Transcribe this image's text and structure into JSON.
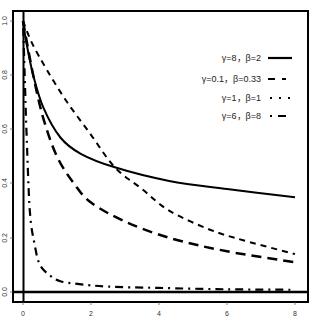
{
  "chart_data": {
    "type": "line",
    "title": "",
    "xlabel": "",
    "ylabel": "",
    "xlim": [
      -0.3,
      8.4
    ],
    "ylim": [
      -0.03,
      1.04
    ],
    "grid": false,
    "legend_position": "top-right",
    "x_ticks": [
      "0",
      "2",
      "4",
      "6",
      "8"
    ],
    "y_ticks": [
      "0.0",
      "0.2",
      "0.4",
      "0.6",
      "0.8",
      "1.0"
    ],
    "reference_lines": {
      "horizontal_y": 0,
      "vertical_x": 0
    },
    "series": [
      {
        "name": "γ=8，β=2",
        "line_style": "solid",
        "x": [
          0,
          0.1,
          0.3,
          0.6,
          1.1,
          1.7,
          2.7,
          4.3,
          6,
          8
        ],
        "values": [
          1.0,
          0.92,
          0.8,
          0.68,
          0.57,
          0.51,
          0.46,
          0.41,
          0.38,
          0.35
        ]
      },
      {
        "name": "γ=0.1，β=0.33",
        "line_style": "dashed",
        "x": [
          0,
          0.26,
          0.7,
          1.3,
          2.0,
          2.7,
          3.5,
          4.3,
          5.5,
          6.5,
          8
        ],
        "values": [
          1.0,
          0.92,
          0.82,
          0.7,
          0.58,
          0.46,
          0.38,
          0.3,
          0.23,
          0.19,
          0.14
        ]
      },
      {
        "name": "γ=1，β=1",
        "line_style": "dotted",
        "x": [
          0,
          0.3,
          0.6,
          1.0,
          1.5,
          2.0,
          3.0,
          4.3,
          6,
          8
        ],
        "values": [
          1.0,
          0.8,
          0.64,
          0.5,
          0.4,
          0.33,
          0.26,
          0.2,
          0.15,
          0.11
        ]
      },
      {
        "name": "γ=6，β=8",
        "line_style": "dotdash",
        "x": [
          0,
          0.05,
          0.1,
          0.2,
          0.35,
          0.5,
          0.8,
          1.1,
          1.6,
          2.5,
          4,
          6,
          8
        ],
        "values": [
          1.0,
          0.8,
          0.6,
          0.3,
          0.17,
          0.1,
          0.06,
          0.04,
          0.03,
          0.02,
          0.015,
          0.01,
          0.008
        ]
      }
    ]
  },
  "legend": {
    "items": [
      {
        "label": "γ=8，β=2"
      },
      {
        "label": "γ=0.1，β=0.33"
      },
      {
        "label": "γ=1，β=1"
      },
      {
        "label": "γ=6，β=8"
      }
    ]
  },
  "axes": {
    "x_tick_labels": [
      "0",
      "2",
      "4",
      "6",
      "8"
    ],
    "y_tick_labels": [
      "0.0",
      "0.2",
      "0.4",
      "0.6",
      "0.8",
      "1.0"
    ]
  }
}
